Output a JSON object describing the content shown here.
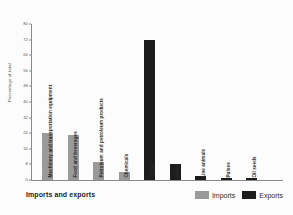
{
  "chart_data": {
    "type": "bar",
    "title": "Imports and exports",
    "xlabel": "",
    "ylabel": "Percentage of total",
    "ylim": [
      0,
      80
    ],
    "yticks": [
      0,
      8,
      16,
      24,
      32,
      40,
      48,
      56,
      64,
      72,
      80
    ],
    "grid": false,
    "legend_position": "bottom-right",
    "categories": [
      "Machinery and transportation equipment",
      "Food and beverages",
      "Petroleum and petroleum products",
      "Chemicals",
      "Coffee",
      "Hides",
      "Live animals",
      "Pulses",
      "Oil seeds"
    ],
    "values": [
      24,
      23,
      9,
      4,
      72,
      8,
      2,
      1,
      1
    ],
    "point_series": [
      "Imports",
      "Imports",
      "Imports",
      "Imports",
      "Exports",
      "Exports",
      "Exports",
      "Exports",
      "Exports"
    ],
    "series": [
      {
        "name": "Imports",
        "color": "#9a9a9a",
        "points": [
          {
            "category": "Machinery and transportation equipment",
            "value": 24
          },
          {
            "category": "Food and beverages",
            "value": 23
          },
          {
            "category": "Petroleum and petroleum products",
            "value": 9
          },
          {
            "category": "Chemicals",
            "value": 4
          }
        ]
      },
      {
        "name": "Exports",
        "color": "#1c1c1c",
        "points": [
          {
            "category": "Coffee",
            "value": 72
          },
          {
            "category": "Hides",
            "value": 8
          },
          {
            "category": "Live animals",
            "value": 2
          },
          {
            "category": "Pulses",
            "value": 1
          },
          {
            "category": "Oil seeds",
            "value": 1
          }
        ]
      }
    ]
  },
  "legend": {
    "items": [
      {
        "label": "Imports",
        "color": "#9a9a9a"
      },
      {
        "label": "Exports",
        "color": "#1c1c1c"
      }
    ]
  }
}
